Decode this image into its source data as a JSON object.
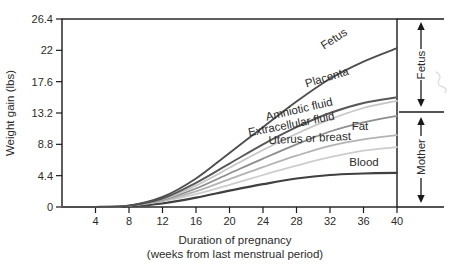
{
  "figure": {
    "y_axis_title": "Weight gain (lbs)",
    "x_axis_title_line1": "Duration of pregnancy",
    "x_axis_title_line2": "(weeks from last menstrual period)",
    "bracket_fetus_label": "Fetus",
    "bracket_mother_label": "Mother",
    "axis_color": "#1a1a1a",
    "text_color": "#2b2b2b"
  },
  "chart_data": {
    "type": "line",
    "title": "",
    "xlabel": "Duration of pregnancy (weeks from last menstrual period)",
    "ylabel": "Weight gain (lbs)",
    "xlim": [
      0,
      40
    ],
    "ylim": [
      0,
      26.4
    ],
    "x_ticks": [
      4,
      8,
      12,
      16,
      20,
      24,
      28,
      32,
      36,
      40
    ],
    "y_ticks": [
      0,
      4.4,
      8.8,
      13.2,
      17.6,
      22,
      26.4
    ],
    "grid": false,
    "legend_position": "inline-labels-on-curves",
    "x": [
      0,
      4,
      8,
      12,
      16,
      20,
      24,
      28,
      32,
      36,
      40
    ],
    "series": [
      {
        "name": "Fetus",
        "key": "fetus",
        "color": "#4f4f4f",
        "values": [
          0,
          0,
          0.2,
          1.4,
          4.0,
          7.6,
          11.2,
          14.8,
          18.0,
          20.4,
          22.3
        ]
      },
      {
        "name": "Placenta",
        "key": "placenta",
        "color": "#585858",
        "values": [
          0,
          0,
          0.2,
          1.2,
          3.4,
          6.1,
          8.8,
          11.2,
          13.2,
          14.6,
          15.4
        ]
      },
      {
        "name": "Amniotic fluid",
        "key": "amniotic",
        "color": "#c6c6c6",
        "values": [
          0,
          0,
          0.2,
          1.1,
          3.0,
          5.5,
          8.0,
          10.3,
          12.3,
          13.9,
          14.9
        ]
      },
      {
        "name": "Extracellular fluid",
        "key": "extracellular",
        "color": "#8e8e8e",
        "values": [
          0,
          0,
          0.2,
          1.0,
          2.6,
          4.7,
          6.8,
          8.8,
          10.6,
          11.9,
          12.8
        ]
      },
      {
        "name": "Fat",
        "key": "fat",
        "color": "#b3b3b3",
        "values": [
          0,
          0,
          0.2,
          0.9,
          2.2,
          3.9,
          5.6,
          7.2,
          8.6,
          9.5,
          10.1
        ]
      },
      {
        "name": "Uterus or breast",
        "key": "uterus",
        "color": "#cdcdcd",
        "values": [
          0,
          0,
          0.2,
          0.8,
          1.8,
          3.1,
          4.5,
          5.8,
          7.0,
          7.9,
          8.4
        ]
      },
      {
        "name": "Blood",
        "key": "blood",
        "color": "#404040",
        "values": [
          0,
          0,
          0.1,
          0.5,
          1.3,
          2.3,
          3.2,
          4.0,
          4.5,
          4.7,
          4.8
        ]
      }
    ],
    "right_annotations": [
      {
        "label": "Fetus",
        "range_lbs": [
          13.2,
          26.4
        ]
      },
      {
        "label": "Mother",
        "range_lbs": [
          0,
          13.2
        ]
      }
    ]
  }
}
